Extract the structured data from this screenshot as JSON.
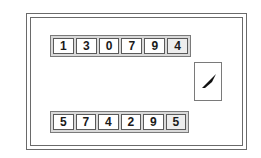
{
  "diagram": {
    "top_row": {
      "digits": [
        "1",
        "3",
        "0",
        "7",
        "9",
        "4"
      ],
      "highlighted_index": 5
    },
    "bottom_row": {
      "digits": [
        "5",
        "7",
        "4",
        "2",
        "9",
        "5"
      ],
      "highlighted_index": 5
    },
    "pointer_panel": {
      "icon": "needle-pointer-icon",
      "direction": "up-right"
    },
    "colors": {
      "frame": "#6a6a6a",
      "row_background": "#d9d9d9",
      "digit_background": "#ffffff",
      "highlight_background": "#ededed",
      "text": "#1a1a1a"
    }
  }
}
